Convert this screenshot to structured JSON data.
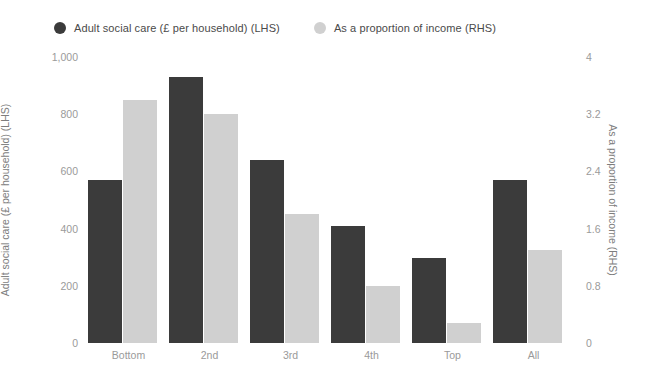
{
  "legend": {
    "items": [
      {
        "label": "Adult social care (£ per household) (LHS)",
        "color": "#3b3b3b",
        "marker": "circle-marker"
      },
      {
        "label": "As a proportion of income (RHS)",
        "color": "#d0d0d0",
        "marker": "circle-marker"
      }
    ]
  },
  "axes": {
    "left": {
      "title": "Adult social care (£ per household) (LHS)",
      "ticks": [
        "0",
        "200",
        "400",
        "600",
        "800",
        "1,000"
      ]
    },
    "right": {
      "title": "As a proportion of income (RHS)",
      "ticks": [
        "0",
        "0.8",
        "1.6",
        "2.4",
        "3.2",
        "4"
      ]
    },
    "bottom": {
      "ticks": [
        "Bottom",
        "2nd",
        "3rd",
        "4th",
        "Top",
        "All"
      ]
    }
  },
  "chart_data": {
    "type": "bar",
    "title": "",
    "xlabel": "",
    "categories": [
      "Bottom",
      "2nd",
      "3rd",
      "4th",
      "Top",
      "All"
    ],
    "series": [
      {
        "name": "Adult social care (£ per household) (LHS)",
        "axis": "left",
        "color": "#3b3b3b",
        "values": [
          570,
          930,
          640,
          410,
          297,
          570
        ]
      },
      {
        "name": "As a proportion of income (RHS)",
        "axis": "right",
        "color": "#d0d0d0",
        "values": [
          3.4,
          3.2,
          1.8,
          0.8,
          0.28,
          1.3
        ]
      }
    ],
    "ylabel": "Adult social care (£ per household) (LHS)",
    "ylabel_right": "As a proportion of income (RHS)",
    "ylim": [
      0,
      1000
    ],
    "ylim_right": [
      0,
      4
    ],
    "ytick_values": [
      0,
      200,
      400,
      600,
      800,
      1000
    ],
    "ytick_values_right": [
      0,
      0.8,
      1.6,
      2.4,
      3.2,
      4
    ],
    "grid": false,
    "legend_position": "top-left",
    "background": "#ffffff"
  }
}
